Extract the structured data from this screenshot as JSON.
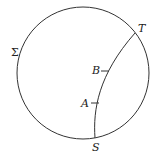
{
  "diagram": {
    "circle_label": "Σ",
    "points": {
      "T": "T",
      "B": "B",
      "A": "A",
      "S": "S"
    },
    "colors": {
      "stroke": "#333333",
      "background": "#ffffff"
    }
  }
}
